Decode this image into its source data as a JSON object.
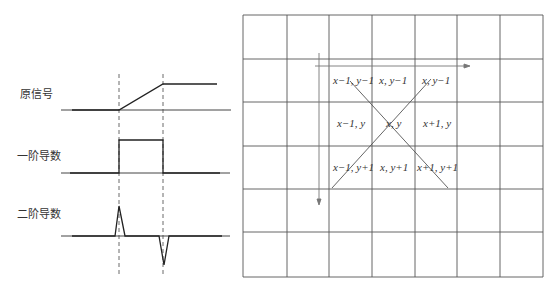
{
  "left_panel": {
    "labels": {
      "original": "原信号",
      "first_derivative": "一阶导数",
      "second_derivative": "二阶导数"
    }
  },
  "right_panel": {
    "grid": {
      "cols": 7,
      "rows": 6
    },
    "cells": {
      "top_left": "x−1, y−1",
      "top_center": "x, y−1",
      "top_right": "x, y−1",
      "mid_left": "x−1, y",
      "center": "x, y",
      "mid_right": "x+1, y",
      "bottom_left": "x−1, y+1",
      "bottom_center": "x, y+1",
      "bottom_right": "x+1, y+1"
    }
  },
  "colors": {
    "line": "#333333",
    "grid": "#555555",
    "arrow": "#777777"
  }
}
